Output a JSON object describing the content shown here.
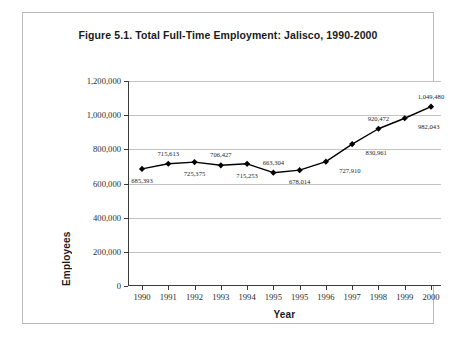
{
  "figure": {
    "title": "Figure 5.1. Total Full-Time Employment: Jalisco, 1990-2000"
  },
  "chart_data": {
    "type": "line",
    "title": "Figure 5.1. Total Full-Time Employment: Jalisco, 1990-2000",
    "xlabel": "Year",
    "ylabel": "Employees",
    "categories": [
      "1990",
      "1991",
      "1992",
      "1993",
      "1994",
      "1995",
      "1995",
      "1996",
      "1997",
      "1998",
      "1999",
      "2000"
    ],
    "values": [
      685393,
      715613,
      725375,
      706427,
      715253,
      663304,
      678014,
      727910,
      830961,
      920472,
      982043,
      1049480
    ],
    "point_labels": [
      "685,393",
      "715,613",
      "725,375",
      "706,427",
      "715,253",
      "663,304",
      "678,014",
      "727,910",
      "830,961",
      "920,472",
      "982,043",
      "1,049,480"
    ],
    "label_positions": [
      "below",
      "above",
      "below",
      "above",
      "below",
      "above",
      "below",
      "right",
      "right",
      "above",
      "right",
      "above"
    ],
    "ylim": [
      0,
      1200000
    ],
    "ytick_labels": [
      "0",
      "200,000",
      "400,000",
      "600,000",
      "800,000",
      "1,000,000",
      "1,200,000"
    ],
    "ytick_values": [
      0,
      200000,
      400000,
      600000,
      800000,
      1000000,
      1200000
    ],
    "grid": "horizontal",
    "legend": "none",
    "marker": "diamond",
    "series_color": "#000000",
    "grid_color": "#c3c3c3",
    "axis_color": "#3a3a3a"
  }
}
